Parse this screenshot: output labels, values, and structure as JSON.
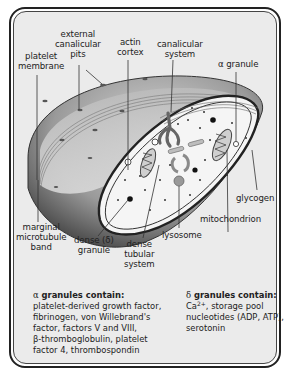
{
  "figure": {
    "colors": {
      "background": "#ebebeb",
      "frame": "#222222",
      "membrane_dark": "#4a4a4a",
      "membrane_light": "#bdbdbd",
      "cytoplasm": "#f4f4f4",
      "organelle": "#9a9a9a"
    }
  },
  "labels": {
    "platelet_membrane": [
      "platelet",
      "membrane"
    ],
    "external_canalicular_pits": [
      "external",
      "canalicular",
      "pits"
    ],
    "actin_cortex": [
      "actin",
      "cortex"
    ],
    "canalicular_system": [
      "canalicular",
      "system"
    ],
    "alpha_granule": "α granule",
    "glycogen": "glycogen",
    "mitochondrion": "mitochondrion",
    "lysosome": "lysosome",
    "dense_tubular_system": [
      "dense",
      "tubular",
      "system"
    ],
    "dense_granule": [
      "dense (δ)",
      "granule"
    ],
    "marginal_microtubule_band": [
      "marginal",
      "microtubule",
      "band"
    ]
  },
  "alpha_box": {
    "symbol": "α",
    "heading": "granules contain:",
    "lines": [
      "platelet-derived growth factor,",
      "fibrinogen, von Willebrand's",
      "factor, factors V and VIII,",
      "β-thromboglobulin, platelet",
      "factor 4, thrombospondin"
    ]
  },
  "delta_box": {
    "symbol": "δ",
    "heading": "granules contain:",
    "line1_prefix": "Ca",
    "line1_sup": "2+",
    "line1_suffix": ", storage pool",
    "lines": [
      "nucleotides (ADP, ATP),",
      "serotonin"
    ]
  }
}
